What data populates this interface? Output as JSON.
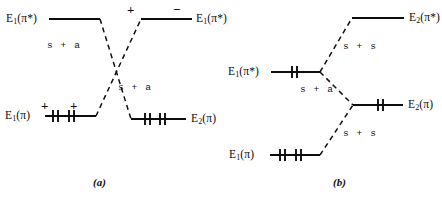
{
  "figure": {
    "type": "orbital-correlation-diagram",
    "panels": [
      {
        "id": "a",
        "caption": "(a)",
        "levels": [
          {
            "name": "upper-left-level",
            "label_base": "E",
            "label_sub": "1",
            "label_paren": "(π*)",
            "label_full": "E1(π*)",
            "label_side": "left",
            "electrons": 0,
            "signs": []
          },
          {
            "name": "upper-right-level",
            "label_base": "E",
            "label_sub": "1",
            "label_paren": "(π*)",
            "label_full": "E1(π*)",
            "label_side": "right",
            "electrons": 0,
            "signs": [
              "+",
              "−"
            ]
          },
          {
            "name": "lower-left-level",
            "label_base": "E",
            "label_sub": "1",
            "label_paren": "(π)",
            "label_full": "E1(π)",
            "label_side": "left",
            "electrons": 4,
            "signs": [
              "+",
              "+"
            ]
          },
          {
            "name": "lower-right-level",
            "label_base": "E",
            "label_sub": "2",
            "label_paren": "(π)",
            "label_full": "E2(π)",
            "label_side": "right",
            "electrons": 4,
            "signs": []
          }
        ],
        "correlation_labels": [
          "s + a",
          "s + a"
        ]
      },
      {
        "id": "b",
        "caption": "(b)",
        "levels": [
          {
            "name": "top-right-level",
            "label_base": "E",
            "label_sub": "2",
            "label_paren": "(π*)",
            "label_full": "E2(π*)",
            "label_side": "right",
            "electrons": 0,
            "signs": []
          },
          {
            "name": "middle-left-level",
            "label_base": "E",
            "label_sub": "1",
            "label_paren": "(π*)",
            "label_full": "E1(π*)",
            "label_side": "left",
            "electrons": 2,
            "signs": []
          },
          {
            "name": "middle-right-level",
            "label_base": "E",
            "label_sub": "2",
            "label_paren": "(π)",
            "label_full": "E2(π)",
            "label_side": "right",
            "electrons": 2,
            "signs": []
          },
          {
            "name": "bottom-left-level",
            "label_base": "E",
            "label_sub": "1",
            "label_paren": "(π)",
            "label_full": "E1(π)",
            "label_side": "left",
            "electrons": 4,
            "signs": []
          }
        ],
        "correlation_labels": [
          "s + s",
          "s + a",
          "s + s"
        ]
      }
    ],
    "colors": {
      "ink": "#0d0d0d",
      "background": "#ffffff"
    }
  }
}
